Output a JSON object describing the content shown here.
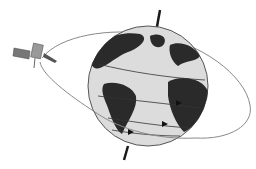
{
  "diagram": {
    "elements": [
      {
        "name": "satellite",
        "icon": "satellite-icon"
      },
      {
        "name": "orbit-path",
        "shape": "ellipse"
      },
      {
        "name": "earth-globe",
        "icon": "globe-icon"
      },
      {
        "name": "rotation-axis",
        "shape": "line"
      },
      {
        "name": "ground-track-lines",
        "count": 3
      }
    ],
    "colors": {
      "background": "#ffffff",
      "ocean": "#d9d9d9",
      "land": "#2a2a2a",
      "orbit": "#8a8a8a",
      "axis": "#1a1a1a"
    }
  }
}
